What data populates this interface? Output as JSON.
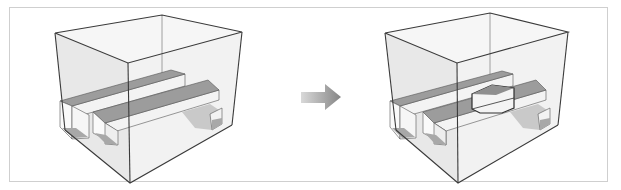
{
  "figure": {
    "colors": {
      "frame_border": "#cfcfcf",
      "box_edge": "#3a3a3a",
      "box_face": "#e6e6e6",
      "beam_top": "#9a9a9a",
      "beam_side": "#f2f2f2",
      "beam_end": "#bcbcbc",
      "arrow": "#8c8c8c"
    },
    "panels": [
      {
        "name": "before",
        "label": ""
      },
      {
        "name": "after",
        "label": ""
      }
    ],
    "arrow": {
      "direction": "right",
      "icon": "right-arrow-icon"
    }
  }
}
